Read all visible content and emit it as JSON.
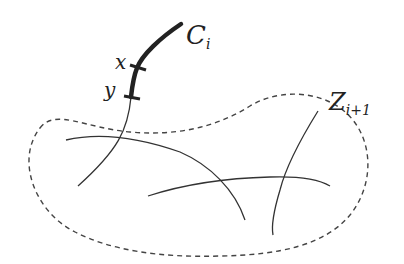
{
  "diagram": {
    "labels": {
      "curve_main": "C",
      "curve_main_sub": "i",
      "point_x": "x",
      "point_y": "y",
      "region": "Z",
      "region_sub": "i+1"
    },
    "colors": {
      "stroke": "#333333",
      "thick_stroke": "#222222",
      "dashed": "#444444",
      "background": "#ffffff"
    },
    "elements": [
      {
        "type": "thick-curve",
        "name": "C_i",
        "description": "bold arc from C_i label down through points x and y"
      },
      {
        "type": "tick",
        "name": "x"
      },
      {
        "type": "tick",
        "name": "y"
      },
      {
        "type": "thin-curve",
        "description": "continuation of C_i into region Z_{i+1}"
      },
      {
        "type": "dashed-closed-curve",
        "name": "Z_{i+1}"
      },
      {
        "type": "thin-curve",
        "description": "curve inside region (left arc)"
      },
      {
        "type": "thin-curve",
        "description": "curve inside region (horizontal arc)"
      },
      {
        "type": "thin-curve",
        "description": "curve inside region (right vertical)"
      }
    ]
  }
}
